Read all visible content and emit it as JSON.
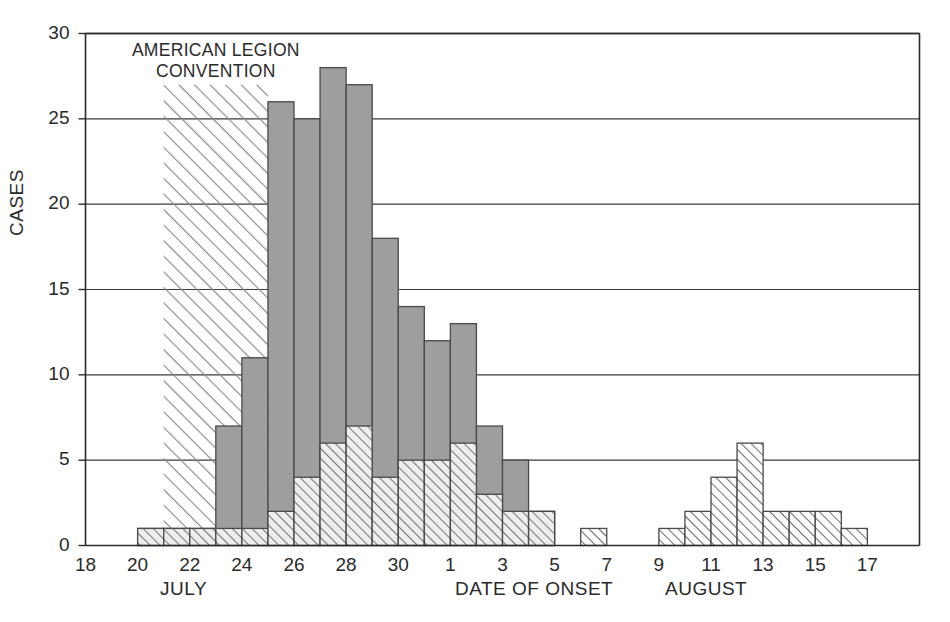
{
  "chart_data": {
    "type": "bar",
    "title": "",
    "xlabel": "DATE OF ONSET",
    "ylabel": "CASES",
    "ylim": [
      0,
      30
    ],
    "ytick_values": [
      0,
      5,
      10,
      15,
      20,
      25,
      30
    ],
    "ytick_labels": [
      "0",
      "5",
      "10",
      "15",
      "20",
      "25",
      "30"
    ],
    "grid": "horizontal",
    "legend_position": "none",
    "x_axis_note": "Daily bins; tick labels at every other day, July 18 through August 17",
    "xtick_labels": [
      "18",
      "20",
      "22",
      "24",
      "26",
      "28",
      "30",
      "1",
      "3",
      "5",
      "7",
      "9",
      "11",
      "13",
      "15",
      "17"
    ],
    "xtick_days": [
      "Jul 18",
      "Jul 20",
      "Jul 22",
      "Jul 24",
      "Jul 26",
      "Jul 28",
      "Jul 30",
      "Aug 1",
      "Aug 3",
      "Aug 5",
      "Aug 7",
      "Aug 9",
      "Aug 11",
      "Aug 13",
      "Aug 15",
      "Aug 17"
    ],
    "month_labels": [
      "JULY",
      "AUGUST"
    ],
    "x": [
      "Jul 18",
      "Jul 19",
      "Jul 20",
      "Jul 21",
      "Jul 22",
      "Jul 23",
      "Jul 24",
      "Jul 25",
      "Jul 26",
      "Jul 27",
      "Jul 28",
      "Jul 29",
      "Jul 30",
      "Jul 31",
      "Aug 1",
      "Aug 2",
      "Aug 3",
      "Aug 4",
      "Aug 5",
      "Aug 6",
      "Aug 7",
      "Aug 8",
      "Aug 9",
      "Aug 10",
      "Aug 11",
      "Aug 12",
      "Aug 13",
      "Aug 14",
      "Aug 15",
      "Aug 16"
    ],
    "series": [
      {
        "name": "solid-gray-bars",
        "style": "gray-filled",
        "color": "#9e9e9e",
        "values": [
          0,
          0,
          1,
          1,
          1,
          7,
          11,
          26,
          25,
          28,
          27,
          18,
          14,
          12,
          13,
          7,
          5,
          2,
          0,
          0,
          0,
          0,
          0,
          0,
          0,
          0,
          0,
          0,
          0,
          0
        ]
      },
      {
        "name": "hatched-bars",
        "style": "diagonal-hatch",
        "color": "#707070",
        "values": [
          0,
          0,
          1,
          1,
          1,
          1,
          1,
          2,
          4,
          6,
          7,
          4,
          5,
          5,
          6,
          3,
          2,
          2,
          0,
          1,
          0,
          0,
          1,
          2,
          4,
          6,
          2,
          2,
          2,
          1
        ]
      }
    ],
    "annotations": [
      {
        "name": "convention-band",
        "text": "AMERICAN LEGION\nCONVENTION",
        "start": "Jul 21",
        "end": "Jul 24",
        "band_height": 27,
        "style": "diagonal-hatch"
      }
    ]
  },
  "axis": {
    "ylabel": "CASES",
    "xlabel": "DATE OF ONSET",
    "month_july": "JULY",
    "month_august": "AUGUST"
  },
  "annotation": {
    "convention": "AMERICAN LEGION\nCONVENTION"
  },
  "colors": {
    "bar_gray_fill": "#9e9e9e",
    "bar_gray_stroke": "#4a4a4a",
    "hatch_stroke": "#6e6e6e",
    "axis": "#2a2a2a",
    "grid": "#3a3a3a",
    "background": "#ffffff"
  }
}
